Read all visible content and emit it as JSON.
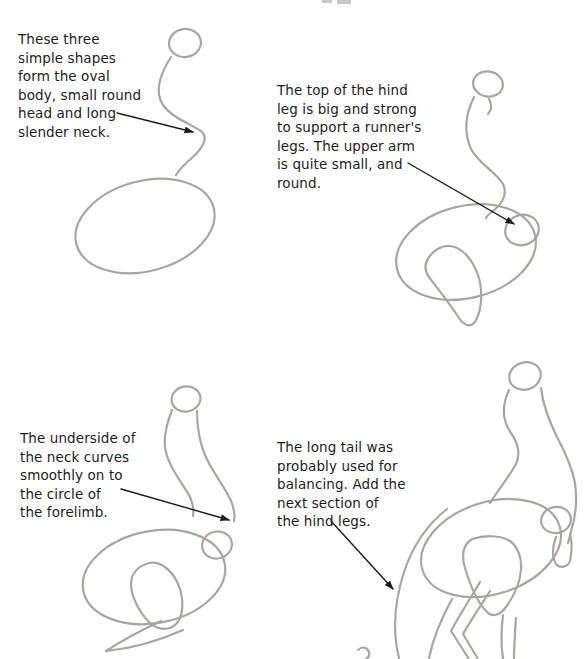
{
  "document": {
    "kind": "drawing-tutorial-page",
    "subject": "step-by-step dinosaur construction sketches",
    "background_color": "#ffffff",
    "pencil_color": "#a9a6a2",
    "text_color": "#1c1c1c",
    "arrow_color": "#1c1c1c"
  },
  "panels": [
    {
      "name": "step-1",
      "caption": "These three\nsimple shapes\nform the oval\nbody, small round\nhead and long\nslender neck.",
      "sketch_parts": [
        "small round head",
        "long slender neck",
        "oval body"
      ],
      "arrow_points_to": "slender neck"
    },
    {
      "name": "step-2",
      "caption": "The top of the hind\nleg is big and strong\nto support a runner's\nlegs. The upper arm\nis quite small, and\nround.",
      "sketch_parts": [
        "small round head",
        "jaw stroke",
        "slender neck",
        "oval body",
        "upper arm circle",
        "hind leg top"
      ],
      "arrow_points_to": "upper arm circle"
    },
    {
      "name": "step-3",
      "caption": "The underside of\nthe neck curves\nsmoothly on to\nthe circle of\nthe forelimb.",
      "sketch_parts": [
        "small round head",
        "thick curved neck",
        "oval body",
        "forelimb circle",
        "hind leg top",
        "tapering forelimb"
      ],
      "arrow_points_to": "underside of neck at forelimb circle"
    },
    {
      "name": "step-4",
      "caption": "The long tail was\nprobably used for\nbalancing. Add the\nnext section of\nthe hind legs.",
      "sketch_parts": [
        "small round head",
        "thick curved neck",
        "oval body",
        "forelimb circle",
        "lower arm segment",
        "hind leg top",
        "lower hind legs",
        "long tail"
      ],
      "arrow_points_to": "long tail"
    }
  ]
}
